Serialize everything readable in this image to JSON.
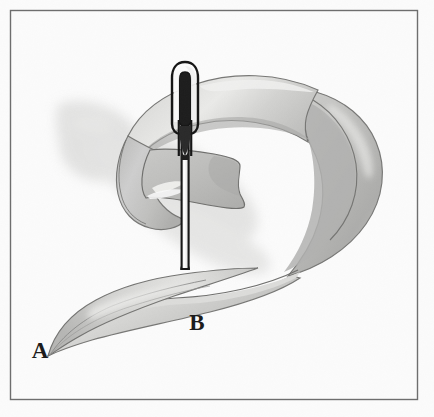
{
  "figure": {
    "type": "grayscale line-and-wash illustration",
    "background_color": "#fbfbfb",
    "frame": {
      "name": "plate-border",
      "color": "#6e6e6e",
      "style": "thin single rule inset from the image edge"
    },
    "labels": [
      {
        "id": "label-a",
        "text": "A",
        "description": "marks the tapered free tip of the band at the lower left",
        "x": 40,
        "y": 358
      },
      {
        "id": "label-b",
        "text": "B",
        "description": "marks the band surface just below where the needle passes through",
        "x": 197,
        "y": 330
      }
    ],
    "objects": [
      {
        "id": "paper-band",
        "name": "paper-band",
        "description": "A long light-gray paper strip looped back on itself with a half twist; its near end tapers to a sharp point at A.",
        "fill_light": "#d8d8d6",
        "fill_mid": "#c3c3c1",
        "fill_dark": "#a9a9a7",
        "outline": "#6a6a6a"
      },
      {
        "id": "needle",
        "name": "sewing-needle",
        "description": "A straight vertical sewing needle with an elongated oval eye at the top, pushed down through both layers of the band.",
        "body_fill": "#fdfdfd",
        "outline": "#111111",
        "top_y": 62,
        "bottom_y": 268,
        "x": 185
      },
      {
        "id": "cast-shadow",
        "name": "cast-shadow",
        "description": "Soft gray shadow cast to the left and below the looped band.",
        "color": "#d4d4d2"
      }
    ],
    "palette": {
      "background": "#fbfbfb",
      "band_light": "#d8d8d6",
      "band_mid": "#c3c3c1",
      "band_dark": "#a9a9a7",
      "outline": "#6a6a6a",
      "needle_outline": "#111111",
      "shadow": "#d4d4d2",
      "label_ink": "#1b1b1b",
      "frame": "#6e6e6e"
    }
  }
}
